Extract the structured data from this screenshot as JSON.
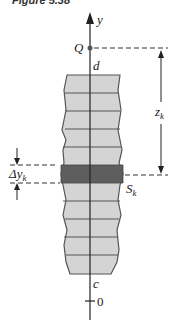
{
  "caption": "Figure 5.38",
  "labels": {
    "axis_y": "y",
    "point_q": "Q",
    "top_d": "d",
    "bottom_c": "c",
    "origin": "0",
    "distance": "z",
    "distance_sub": "k",
    "strip_width": "Δy",
    "strip_width_sub": "k",
    "strip": "S",
    "strip_sub": "k"
  },
  "colors": {
    "plate_fill": "#d4d4d4",
    "strip_fill": "#5e5e5e",
    "outline": "#555555"
  }
}
